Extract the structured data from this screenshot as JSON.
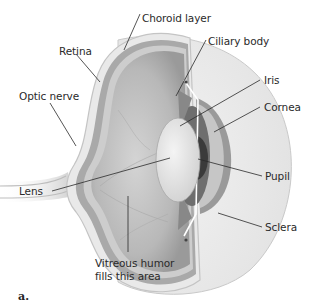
{
  "figure": {
    "panel_label": "a.",
    "labels": {
      "choroid_layer": "Choroid layer",
      "retina": "Retina",
      "ciliary_body": "Ciliary body",
      "optic_nerve": "Optic nerve",
      "iris": "Iris",
      "cornea": "Cornea",
      "lens": "Lens",
      "pupil": "Pupil",
      "sclera": "Sclera",
      "vitreous_line1": "Vitreous humor",
      "vitreous_line2": "fills this area"
    },
    "colors": {
      "background": "#ffffff",
      "sclera": "#ececec",
      "choroid": "#a9a9a9",
      "retina_inner": "#c8c8c8",
      "vitreous": "#b4b4b4",
      "lens": "#e6e6e6",
      "iris": "#6e6e6e",
      "pupil": "#3a3a3a",
      "cornea": "#8f8f8f",
      "leader_line": "#2a2a2a",
      "text": "#2a2a2a"
    }
  }
}
